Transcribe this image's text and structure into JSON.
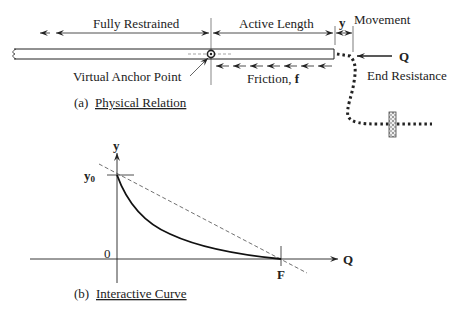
{
  "figure": {
    "panel_a": {
      "caption_prefix": "(a)",
      "caption_title": "Physical Relation",
      "labels": {
        "fully_restrained": "Fully Restrained",
        "active_length": "Active Length",
        "movement_symbol": "y",
        "movement": "Movement",
        "virtual_anchor_point": "Virtual Anchor Point",
        "friction": "Friction, ",
        "friction_symbol": "f",
        "end_force": "Q",
        "end_resistance": "End Resistance"
      }
    },
    "panel_b": {
      "caption_prefix": "(b)",
      "caption_title": "Interactive Curve",
      "labels": {
        "y_axis": "y",
        "x_axis": "Q",
        "y_intercept": "y",
        "y_intercept_sub": "0",
        "origin": "0",
        "x_intercept": "F"
      }
    },
    "colors": {
      "line": "#222222",
      "guide": "#555555",
      "background": "#ffffff"
    }
  }
}
